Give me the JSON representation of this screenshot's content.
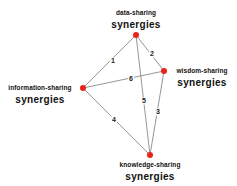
{
  "diagram": {
    "type": "graph",
    "nodes": [
      {
        "id": "data",
        "line1": "data-sharing",
        "line2": "synergies",
        "x": 136,
        "y": 35
      },
      {
        "id": "wisdom",
        "line1": "wisdom-sharing",
        "line2": "synergies",
        "x": 164,
        "y": 71
      },
      {
        "id": "information",
        "line1": "information-sharing",
        "line2": "synergies",
        "x": 83,
        "y": 88
      },
      {
        "id": "knowledge",
        "line1": "knowledge-sharing",
        "line2": "synergies",
        "x": 150,
        "y": 155
      }
    ],
    "edges": [
      {
        "label": "1",
        "from": "data",
        "to": "information",
        "lx": 113,
        "ly": 61
      },
      {
        "label": "2",
        "from": "data",
        "to": "wisdom",
        "lx": 152,
        "ly": 54
      },
      {
        "label": "3",
        "from": "wisdom",
        "to": "knowledge",
        "lx": 158,
        "ly": 112
      },
      {
        "label": "4",
        "from": "information",
        "to": "knowledge",
        "lx": 114,
        "ly": 120
      },
      {
        "label": "5",
        "from": "data",
        "to": "knowledge",
        "lx": 144,
        "ly": 101
      },
      {
        "label": "6",
        "from": "information",
        "to": "wisdom",
        "lx": 131,
        "ly": 79
      }
    ],
    "colors": {
      "node": "#e8231c",
      "edge": "#8a8a8a",
      "text": "#111111"
    }
  }
}
